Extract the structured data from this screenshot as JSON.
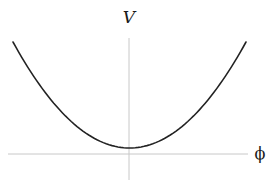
{
  "figure": {
    "title": "",
    "y_axis_label": "V",
    "x_axis_label": "ϕ",
    "colors": {
      "curve": "#222222",
      "axes": "#c8c8c8",
      "background": "#ffffff"
    }
  },
  "chart_data": {
    "type": "line",
    "title": "",
    "xlabel": "ϕ",
    "ylabel": "V",
    "function": "V = a·ϕ² + c",
    "x": [
      -1.0,
      -0.75,
      -0.5,
      -0.25,
      0.0,
      0.25,
      0.5,
      0.75,
      1.0
    ],
    "series": [
      {
        "name": "V(ϕ)",
        "values": [
          1.0,
          0.5625,
          0.25,
          0.0625,
          0.0,
          0.0625,
          0.25,
          0.5625,
          1.0
        ]
      }
    ],
    "minimum": {
      "x": 0.0,
      "y": 0.0
    },
    "xlim": [
      -1.0,
      1.0
    ],
    "grid": false,
    "ticks": false,
    "legend": false
  }
}
